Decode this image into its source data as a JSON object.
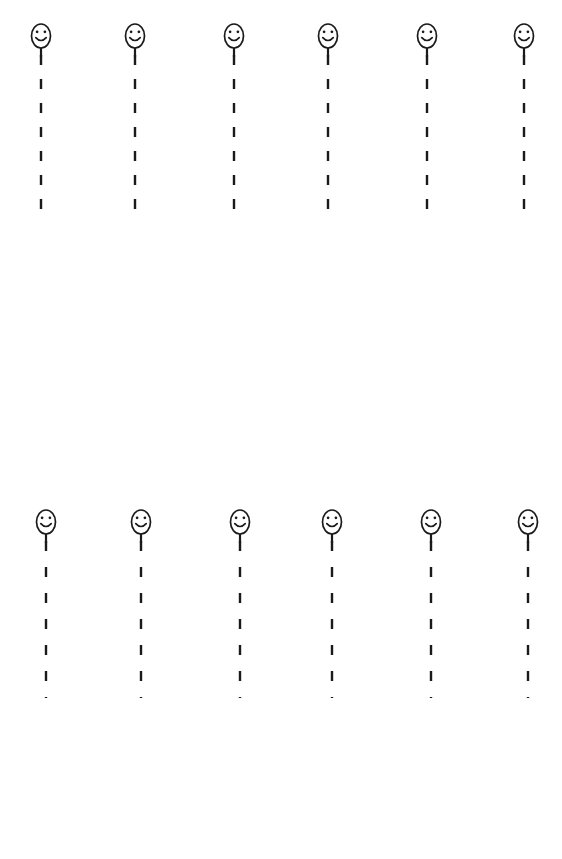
{
  "page": {
    "background_color": "#ffffff",
    "ink_color": "#1a1a1a",
    "width": 562,
    "height": 859
  },
  "figure": {
    "icon_name": "smiley-face-balloon",
    "face_shape": "ellipse",
    "face_width": 19,
    "face_height": 24,
    "eye_count": 2,
    "mouth": "smile-arc",
    "stub_length": 9,
    "line_style": "dashed-vertical"
  },
  "rows": [
    {
      "name": "row-1",
      "top": 22,
      "face_center_y": 14,
      "dash_start": 33,
      "dash_end": 190,
      "dash_length": 10,
      "dash_gap": 14,
      "columns": [
        {
          "label": "col-1",
          "x": 41
        },
        {
          "label": "col-2",
          "x": 135
        },
        {
          "label": "col-3",
          "x": 234
        },
        {
          "label": "col-4",
          "x": 328
        },
        {
          "label": "col-5",
          "x": 427
        },
        {
          "label": "col-6",
          "x": 524
        }
      ]
    },
    {
      "name": "row-2",
      "top": 508,
      "face_center_y": 14,
      "dash_start": 33,
      "dash_end": 190,
      "dash_length": 10,
      "dash_gap": 16,
      "columns": [
        {
          "label": "col-1",
          "x": 46
        },
        {
          "label": "col-2",
          "x": 141
        },
        {
          "label": "col-3",
          "x": 240
        },
        {
          "label": "col-4",
          "x": 332
        },
        {
          "label": "col-5",
          "x": 431
        },
        {
          "label": "col-6",
          "x": 528
        }
      ]
    }
  ]
}
